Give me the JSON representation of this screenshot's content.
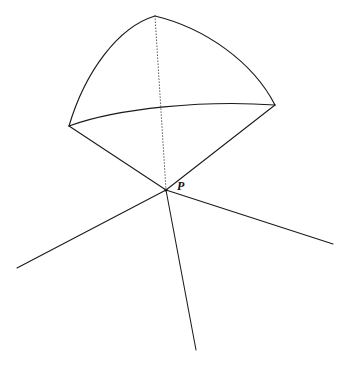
{
  "figure": {
    "type": "geometry-diagram",
    "canvas": {
      "width": 350,
      "height": 369,
      "background": "#ffffff"
    },
    "stroke_color": "#1a1a1a",
    "dotted_color": "#4a4a4a",
    "labels": [
      {
        "id": "P",
        "text": "P",
        "x": 177,
        "y": 180,
        "style": "italic-serif-bold",
        "font_size": 12
      }
    ],
    "points": [
      {
        "id": "apex",
        "name": "apex-point",
        "x": 155,
        "y": 16
      },
      {
        "id": "left",
        "name": "left-vertex",
        "x": 69,
        "y": 126
      },
      {
        "id": "right",
        "name": "right-vertex",
        "x": 275,
        "y": 105
      },
      {
        "id": "P",
        "name": "point-p-vertex",
        "x": 166,
        "y": 190
      },
      {
        "id": "ray_left_end",
        "name": "left-ray-endpoint",
        "x": 17,
        "y": 268
      },
      {
        "id": "ray_right_end",
        "name": "right-ray-endpoint",
        "x": 333,
        "y": 244
      },
      {
        "id": "ray_down_end",
        "name": "down-ray-endpoint",
        "x": 196,
        "y": 350
      }
    ],
    "paths": {
      "arc_apex_left": {
        "name": "arc-apex-to-left-vertex",
        "d": "M 155 16 C 118 27 85 72 69 126",
        "style": "solid"
      },
      "arc_apex_right": {
        "name": "arc-apex-to-right-vertex",
        "d": "M 155 16 C 205 28 253 62 275 105",
        "style": "solid"
      },
      "arc_base": {
        "name": "arc-left-to-right-vertex",
        "d": "M 69 126 C 118 108 205 100 275 105",
        "style": "solid"
      },
      "edge_left_P": {
        "name": "edge-left-vertex-to-p",
        "d": "M 69 126 L 166 190",
        "style": "solid"
      },
      "edge_right_P": {
        "name": "edge-right-vertex-to-p",
        "d": "M 275 105 L 166 190",
        "style": "solid"
      },
      "axis_dotted": {
        "name": "dotted-axis-apex-to-p",
        "d": "M 155 16 L 166 190",
        "style": "dotted"
      },
      "ray_left": {
        "name": "ray-p-to-lower-left",
        "d": "M 166 190 L 17 268",
        "style": "solid"
      },
      "ray_right": {
        "name": "ray-p-to-lower-right",
        "d": "M 166 190 L 333 244",
        "style": "solid"
      },
      "ray_down": {
        "name": "ray-p-downward",
        "d": "M 166 190 L 196 350",
        "style": "solid"
      }
    }
  }
}
